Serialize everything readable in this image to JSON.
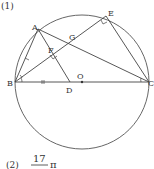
{
  "part1": {
    "label": "(1)"
  },
  "part2": {
    "label": "(2)",
    "numerator": "17",
    "symbol": "π"
  },
  "points": {
    "A": "A",
    "B": "B",
    "C": "C",
    "D": "D",
    "E": "E",
    "F": "F",
    "G": "G",
    "O": "O"
  },
  "colors": {
    "stroke": "#555555",
    "text": "#333333"
  }
}
